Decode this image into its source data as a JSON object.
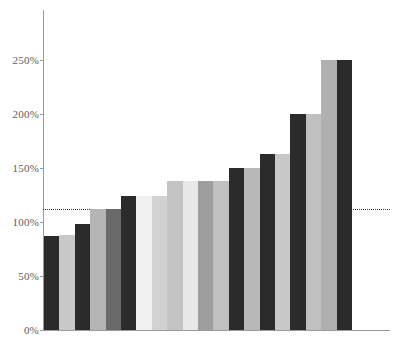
{
  "chart_data": {
    "type": "bar",
    "title": "",
    "subtitle": "",
    "xlabel": "",
    "ylabel": "",
    "categories": [
      "1",
      "2",
      "3",
      "4",
      "5",
      "6",
      "7",
      "8",
      "9",
      "10",
      "11",
      "12",
      "13",
      "14",
      "15",
      "16",
      "17",
      "18",
      "19",
      "20"
    ],
    "values": [
      87,
      88,
      98,
      112,
      112,
      124,
      124,
      124,
      138,
      138,
      138,
      138,
      150,
      150,
      163,
      163,
      200,
      200,
      250,
      250
    ],
    "bar_colors": [
      "#2b2b2b",
      "#c8c8c8",
      "#2b2b2b",
      "#b4b4b4",
      "#696969",
      "#2b2b2b",
      "#f0f0f0",
      "#d2d2d2",
      "#c4c4c4",
      "#e8e8e8",
      "#9e9e9e",
      "#c0c0c0",
      "#2b2b2b",
      "#b8b8b8",
      "#2b2b2b",
      "#c8c8c8",
      "#2b2b2b",
      "#c0c0c0",
      "#b0b0b0",
      "#2b2b2b"
    ],
    "y_ticks": [
      "0%",
      "50%",
      "100%",
      "150%",
      "200%",
      "250%"
    ],
    "y_tick_values": [
      0,
      50,
      100,
      150,
      200,
      250
    ],
    "ylim": [
      0,
      296
    ],
    "x_tick_labels": [],
    "grid": false,
    "legend": null,
    "reference_line": {
      "value": 112,
      "style": "dotted",
      "color": "#3a3a3a",
      "label": ""
    },
    "annotations": [],
    "axis_color": "#9a9a9a",
    "tick_label_color": "#5d5d5d",
    "background_color": "#ffffff"
  }
}
